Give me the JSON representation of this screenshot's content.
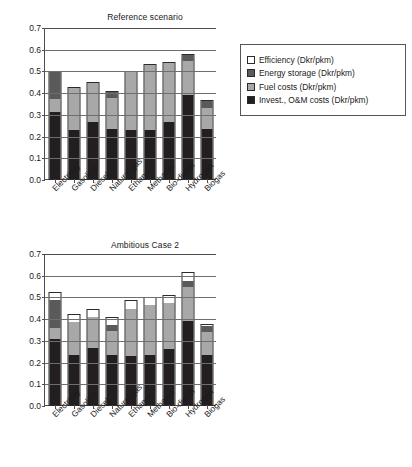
{
  "figure": {
    "units": "Dkr/pkm",
    "panels": [
      "Reference scenario",
      "Ambitious Case 2"
    ]
  },
  "legend": {
    "position": "right-of-top-panel",
    "items": [
      {
        "label": "Efficiency (Dkr/pkm)",
        "color": "#ffffff",
        "swatch": "legend-swatch-efficiency"
      },
      {
        "label": "Energy storage (Dkr/pkm)",
        "color": "#5a5a5a",
        "swatch": "legend-swatch-energy-storage"
      },
      {
        "label": "Fuel costs (Dkr/pkm)",
        "color": "#a8a8a8",
        "swatch": "legend-swatch-fuel-costs"
      },
      {
        "label": "Invest., O&M costs (Dkr/pkm)",
        "color": "#231f20",
        "swatch": "legend-swatch-invest-om"
      }
    ]
  },
  "chart_data": [
    {
      "type": "bar",
      "stacked": true,
      "title": "Reference scenario",
      "xlabel": "",
      "ylabel": "",
      "ylim": [
        0.0,
        0.7
      ],
      "yticks": [
        0.0,
        0.1,
        0.2,
        0.3,
        0.4,
        0.5,
        0.6,
        0.7
      ],
      "ytick_labels": [
        "0.0",
        "0.1",
        "0.2",
        "0.3",
        "0.4",
        "0.5",
        "0.6",
        "0.7"
      ],
      "grid": true,
      "legend": "right",
      "categories": [
        "Electricity",
        "Gasoline",
        "Diesel",
        "Natural gas",
        "Ethanol",
        "Methanol",
        "Bio-diesel",
        "Hydrogen",
        "Biogas"
      ],
      "series": [
        {
          "name": "Invest., O&M costs (Dkr/pkm)",
          "color": "#231f20",
          "values": [
            0.31,
            0.228,
            0.263,
            0.231,
            0.228,
            0.227,
            0.263,
            0.385,
            0.23
          ]
        },
        {
          "name": "Fuel costs (Dkr/pkm)",
          "color": "#a8a8a8",
          "values": [
            0.058,
            0.192,
            0.178,
            0.144,
            0.264,
            0.296,
            0.27,
            0.159,
            0.096
          ]
        },
        {
          "name": "Energy storage (Dkr/pkm)",
          "color": "#5a5a5a",
          "values": [
            0.126,
            0.0,
            0.0,
            0.027,
            0.0,
            0.0,
            0.0,
            0.027,
            0.034
          ]
        },
        {
          "name": "Efficiency (Dkr/pkm)",
          "color": "#ffffff",
          "values": [
            0.0,
            0.0,
            0.0,
            0.0,
            0.0,
            0.0,
            0.0,
            0.0,
            0.0
          ]
        }
      ],
      "totals": [
        0.494,
        0.42,
        0.441,
        0.402,
        0.492,
        0.523,
        0.533,
        0.571,
        0.36
      ]
    },
    {
      "type": "bar",
      "stacked": true,
      "title": "Ambitious Case 2",
      "xlabel": "",
      "ylabel": "",
      "ylim": [
        0.0,
        0.7
      ],
      "yticks": [
        0.0,
        0.1,
        0.2,
        0.3,
        0.4,
        0.5,
        0.6,
        0.7
      ],
      "ytick_labels": [
        "0.0",
        "0.1",
        "0.2",
        "0.3",
        "0.4",
        "0.5",
        "0.6",
        "0.7"
      ],
      "grid": true,
      "legend": "none",
      "categories": [
        "Electricity",
        "Gasoline",
        "Diesel",
        "Natural gas",
        "Ethanol",
        "Methanol",
        "Bio-diesel",
        "Hydrogen",
        "Biogas"
      ],
      "series": [
        {
          "name": "Invest., O&M costs (Dkr/pkm)",
          "color": "#231f20",
          "values": [
            0.305,
            0.23,
            0.261,
            0.229,
            0.228,
            0.229,
            0.258,
            0.388,
            0.229
          ]
        },
        {
          "name": "Fuel costs (Dkr/pkm)",
          "color": "#a8a8a8",
          "values": [
            0.052,
            0.151,
            0.144,
            0.113,
            0.216,
            0.231,
            0.213,
            0.156,
            0.105
          ]
        },
        {
          "name": "Energy storage (Dkr/pkm)",
          "color": "#5a5a5a",
          "values": [
            0.126,
            0.0,
            0.0,
            0.026,
            0.0,
            0.0,
            0.0,
            0.026,
            0.029
          ]
        },
        {
          "name": "Efficiency (Dkr/pkm)",
          "color": "#ffffff",
          "values": [
            0.032,
            0.032,
            0.031,
            0.034,
            0.036,
            0.034,
            0.033,
            0.036,
            0.006
          ]
        }
      ],
      "totals": [
        0.515,
        0.413,
        0.436,
        0.402,
        0.48,
        0.494,
        0.504,
        0.606,
        0.369
      ]
    }
  ]
}
